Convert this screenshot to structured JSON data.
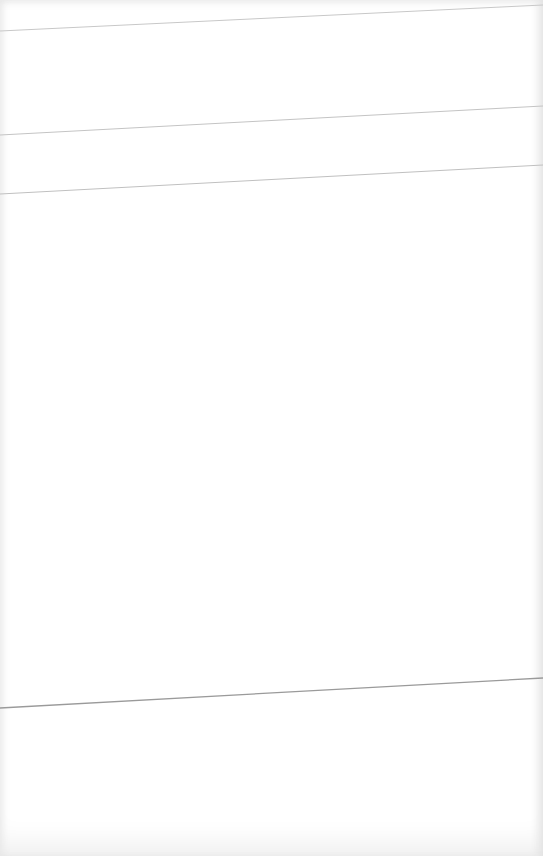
{
  "page": {
    "background_color": "#ffffff",
    "edge_shade_color": "#e4e4e4"
  },
  "rules": [
    {
      "name": "rule-line-1",
      "x1": 0,
      "y1": 31,
      "x2": 543,
      "y2": 5,
      "color": "#c8c8c8",
      "width": 1
    },
    {
      "name": "rule-line-2",
      "x1": 0,
      "y1": 135,
      "x2": 543,
      "y2": 106,
      "color": "#c4c4c4",
      "width": 1
    },
    {
      "name": "rule-line-3",
      "x1": 0,
      "y1": 194,
      "x2": 543,
      "y2": 165,
      "color": "#c0c0c0",
      "width": 1
    },
    {
      "name": "rule-line-4",
      "x1": 0,
      "y1": 708,
      "x2": 543,
      "y2": 678,
      "color": "#9a9a9a",
      "width": 1.3
    }
  ]
}
